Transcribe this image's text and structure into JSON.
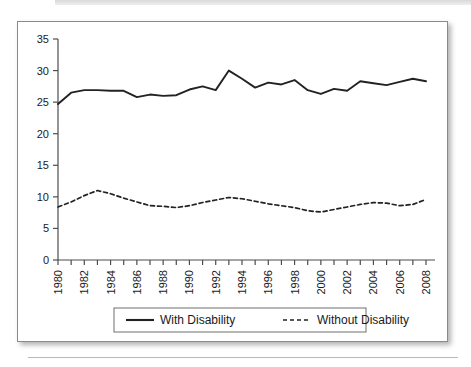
{
  "figure": {
    "frame_border_color": "#8a8a8a",
    "background_color": "#ffffff",
    "line_color": "#222222"
  },
  "chart_data": {
    "type": "line",
    "title": "",
    "subtitle": "",
    "xlabel": "",
    "ylabel": "",
    "grid": false,
    "legend_position": "bottom",
    "xlim": [
      1980,
      2008
    ],
    "ylim": [
      0,
      35
    ],
    "ytick_labels": [
      "0",
      "5",
      "10",
      "15",
      "20",
      "25",
      "30",
      "35"
    ],
    "yticks": [
      0,
      5,
      10,
      15,
      20,
      25,
      30,
      35
    ],
    "x": [
      1980,
      1981,
      1982,
      1983,
      1984,
      1985,
      1986,
      1987,
      1988,
      1989,
      1990,
      1991,
      1992,
      1993,
      1994,
      1995,
      1996,
      1997,
      1998,
      1999,
      2000,
      2001,
      2002,
      2003,
      2004,
      2005,
      2006,
      2007,
      2008
    ],
    "xtick_labels": [
      "1980",
      "1982",
      "1984",
      "1986",
      "1988",
      "1990",
      "1992",
      "1994",
      "1996",
      "1998",
      "2000",
      "2002",
      "2004",
      "2006",
      "2008"
    ],
    "xticks_minor_every": 1,
    "series": [
      {
        "name": "With Disability",
        "style": "solid",
        "color": "#222222",
        "values": [
          24.7,
          26.5,
          26.9,
          26.9,
          26.8,
          26.8,
          25.8,
          26.2,
          26.0,
          26.1,
          27.0,
          27.5,
          26.9,
          30.0,
          28.7,
          27.3,
          28.1,
          27.8,
          28.5,
          26.9,
          26.3,
          27.1,
          26.8,
          28.3,
          28.0,
          27.7,
          28.2,
          28.7,
          28.3
        ]
      },
      {
        "name": "Without Disability",
        "style": "dashed",
        "color": "#222222",
        "values": [
          8.4,
          9.2,
          10.2,
          11.0,
          10.5,
          9.8,
          9.2,
          8.6,
          8.5,
          8.3,
          8.6,
          9.1,
          9.5,
          9.9,
          9.7,
          9.3,
          8.9,
          8.6,
          8.3,
          7.8,
          7.6,
          8.0,
          8.4,
          8.8,
          9.1,
          9.0,
          8.6,
          8.8,
          9.6
        ]
      }
    ]
  },
  "legend": {
    "entries": [
      {
        "label": "With Disability",
        "style": "solid"
      },
      {
        "label": "Without Disability",
        "style": "dashed"
      }
    ]
  }
}
